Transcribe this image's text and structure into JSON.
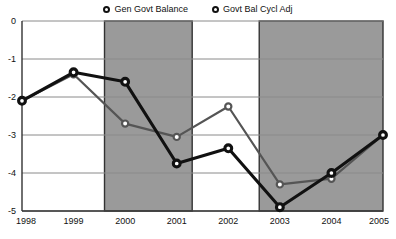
{
  "legend": {
    "position": "top-center",
    "entries": [
      {
        "label": "Gen Govt Balance",
        "marker": "circle-open-icon",
        "color": "#111111"
      },
      {
        "label": "Govt Bal Cycl Adj",
        "marker": "circle-open-icon",
        "color": "#555555"
      }
    ]
  },
  "colors": {
    "series_dark": "#111111",
    "series_gray": "#555555",
    "shaded_band": "#9a9a9a",
    "gridline": "#8a8a8a",
    "axis": "#333333",
    "background": "#ffffff"
  },
  "chart_data": {
    "type": "line",
    "title": "",
    "xlabel": "",
    "ylabel": "",
    "x": [
      1998,
      1999,
      2000,
      2001,
      2002,
      2003,
      2004,
      2005
    ],
    "categories": [
      "1998",
      "1999",
      "2000",
      "2001",
      "2002",
      "2003",
      "2004",
      "2005"
    ],
    "xticklabels": [
      "1998",
      "1999",
      "2000",
      "2001",
      "2002",
      "2003",
      "2004",
      "2005"
    ],
    "yticklabels": [
      "0",
      "-1",
      "-2",
      "-3",
      "-4",
      "-5"
    ],
    "yticks": [
      0,
      -1,
      -2,
      -3,
      -4,
      -5
    ],
    "ylim": [
      -5,
      0
    ],
    "xlim": [
      1998,
      2005
    ],
    "grid": true,
    "legend_position": "top-center",
    "series": [
      {
        "name": "Gen Govt Balance",
        "color": "#111111",
        "values": [
          -2.1,
          -1.35,
          -1.6,
          -3.75,
          -3.35,
          -4.9,
          -4.0,
          -3.0
        ]
      },
      {
        "name": "Govt Bal Cycl Adj",
        "color": "#555555",
        "values": [
          -2.1,
          -1.4,
          -2.7,
          -3.05,
          -2.25,
          -4.3,
          -4.15,
          -3.0
        ]
      }
    ],
    "shaded_bands": [
      {
        "x_start": 1999.6,
        "x_end": 2001.3,
        "color": "#9a9a9a"
      },
      {
        "x_start": 2002.6,
        "x_end": 2005.0,
        "color": "#9a9a9a"
      }
    ]
  }
}
